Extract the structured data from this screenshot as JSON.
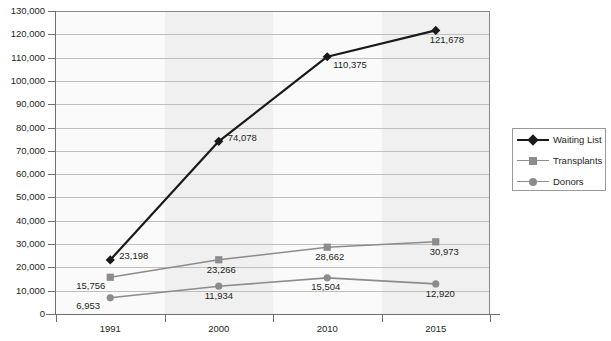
{
  "chart_data": {
    "type": "line",
    "title": "",
    "xlabel": "",
    "ylabel": "",
    "categories": [
      "1991",
      "2000",
      "2010",
      "2015"
    ],
    "ylim": [
      0,
      130000
    ],
    "ytick_step": 10000,
    "grid": true,
    "legend_position": "right",
    "series": [
      {
        "name": "Waiting List",
        "color": "#1a1a1a",
        "marker": "diamond",
        "values": [
          23198,
          74078,
          110375,
          121678
        ],
        "labels": [
          "23,198",
          "74,078",
          "110,375",
          "121,678"
        ]
      },
      {
        "name": "Transplants",
        "color": "#8c8c8c",
        "marker": "square",
        "values": [
          15756,
          23266,
          28662,
          30973
        ],
        "labels": [
          "15,756",
          "23,266",
          "28,662",
          "30,973"
        ]
      },
      {
        "name": "Donors",
        "color": "#8c8c8c",
        "marker": "circle",
        "values": [
          6953,
          11934,
          15504,
          12920
        ],
        "labels": [
          "6,953",
          "11,934",
          "15,504",
          "12,920"
        ]
      }
    ]
  },
  "axes": {
    "y_tick_labels": [
      "0",
      "10,000",
      "20,000",
      "30,000",
      "40,000",
      "50,000",
      "60,000",
      "70,000",
      "80,000",
      "90,000",
      "100,000",
      "110,000",
      "120,000",
      "130,000"
    ],
    "x_tick_labels": [
      "1991",
      "2000",
      "2010",
      "2015"
    ]
  },
  "legend": {
    "entries": [
      {
        "label": "Waiting List",
        "color": "#1a1a1a",
        "marker": "diamond"
      },
      {
        "label": "Transplants",
        "color": "#8c8c8c",
        "marker": "square"
      },
      {
        "label": "Donors",
        "color": "#8c8c8c",
        "marker": "circle"
      }
    ]
  },
  "title_sliver": {
    "text": ""
  },
  "colors": {
    "waiting_list": "#1a1a1a",
    "transplants": "#8c8c8c",
    "donors": "#8c8c8c",
    "gridline": "#bfbfbf",
    "axis": "#6f6f6f",
    "plot_bg": "#fafafa",
    "band": "#f0f0f0",
    "text": "#231f20"
  }
}
